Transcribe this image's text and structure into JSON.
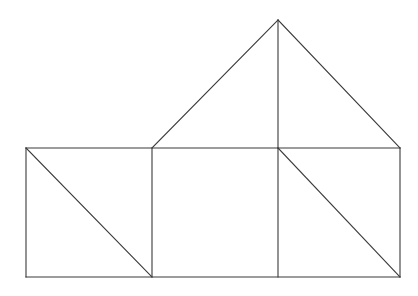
{
  "figure": {
    "canvas": {
      "width": 418,
      "height": 296,
      "background": "#ffffff"
    },
    "style": {
      "stroke_color": "#3a3a3a",
      "stroke_width": 1.1,
      "fill_color": "#ffffff"
    },
    "points": {
      "base_left_top": {
        "name": "A",
        "x": 26,
        "y": 148
      },
      "base_left_bottom": {
        "name": "B",
        "x": 26,
        "y": 277
      },
      "divider1_top": {
        "name": "C",
        "x": 152,
        "y": 148
      },
      "divider1_bottom": {
        "name": "D",
        "x": 152,
        "y": 277
      },
      "divider2_top": {
        "name": "E",
        "x": 278,
        "y": 148
      },
      "divider2_bottom": {
        "name": "F",
        "x": 278,
        "y": 277
      },
      "base_right_top": {
        "name": "G",
        "x": 400,
        "y": 148
      },
      "base_right_bottom": {
        "name": "H",
        "x": 400,
        "y": 277
      },
      "roof_apex": {
        "name": "P",
        "x": 278,
        "y": 20
      }
    },
    "segments": [
      {
        "id": "base-top-edge",
        "label": "Top edge of rectangle band",
        "from": "base_left_top",
        "to": "base_right_top"
      },
      {
        "id": "base-bottom-edge",
        "label": "Bottom edge of rectangle band",
        "from": "base_left_bottom",
        "to": "base_right_bottom"
      },
      {
        "id": "base-left-edge",
        "label": "Left edge of rectangle band",
        "from": "base_left_top",
        "to": "base_left_bottom"
      },
      {
        "id": "base-right-edge",
        "label": "Right edge of rectangle band",
        "from": "base_right_top",
        "to": "base_right_bottom"
      },
      {
        "id": "divider-1",
        "label": "First vertical divider",
        "from": "divider1_top",
        "to": "divider1_bottom"
      },
      {
        "id": "divider-2",
        "label": "Second vertical divider",
        "from": "divider2_top",
        "to": "divider2_bottom"
      },
      {
        "id": "left-rect-diagonal",
        "label": "Diagonal of left rectangle",
        "from": "base_left_top",
        "to": "divider1_bottom"
      },
      {
        "id": "right-rect-diagonal",
        "label": "Diagonal of right rectangle",
        "from": "divider2_top",
        "to": "base_right_bottom"
      },
      {
        "id": "roof-left-slope",
        "label": "Left slope of triangular roof",
        "from": "divider1_top",
        "to": "roof_apex"
      },
      {
        "id": "roof-right-slope",
        "label": "Right slope of triangular roof",
        "from": "roof_apex",
        "to": "base_right_top"
      },
      {
        "id": "roof-altitude",
        "label": "Vertical altitude of roof",
        "from": "roof_apex",
        "to": "divider2_top"
      }
    ],
    "regions": [
      {
        "id": "left-rectangle",
        "label": "Left rectangle (split by diagonal)",
        "shape": "rect",
        "cells": 2
      },
      {
        "id": "middle-rectangle",
        "label": "Middle rectangle (undivided)",
        "shape": "rect",
        "cells": 1
      },
      {
        "id": "right-rectangle",
        "label": "Right rectangle (split by diagonal)",
        "shape": "rect",
        "cells": 2
      },
      {
        "id": "roof-triangle",
        "label": "Triangular roof (split by altitude)",
        "shape": "triangle",
        "cells": 2
      }
    ]
  }
}
